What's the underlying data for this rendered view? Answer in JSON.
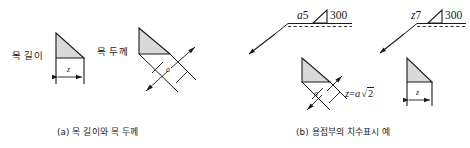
{
  "figure": {
    "panel_a": {
      "caption": "(a) 목 길이와 목 두께",
      "throat_length_label": "목 길이",
      "throat_thickness_label": "목 두께",
      "dimension_z": "z",
      "dimension_a": "a"
    },
    "panel_b": {
      "caption": "(b) 용접부의 치수표시 예",
      "symbol_left": {
        "size_prefix": "a",
        "size_value": "5",
        "weld_symbol": "fillet-weld-triangle",
        "length_value": "300"
      },
      "symbol_right": {
        "size_prefix": "z",
        "size_value": "7",
        "weld_symbol": "fillet-weld-triangle",
        "length_value": "300"
      },
      "dimension_a": "a",
      "dimension_z": "z",
      "formula_lhs": "z",
      "formula_eq": "=",
      "formula_coef": "a",
      "formula_radical": "√",
      "formula_radicand": "2"
    }
  },
  "colors": {
    "line": "#1a1a1a",
    "hatch_fill": "#d9d9d9",
    "background": "#ffffff"
  }
}
